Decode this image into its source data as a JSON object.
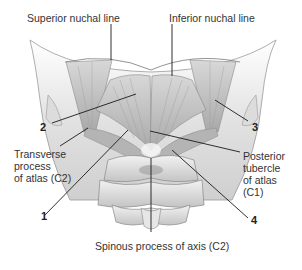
{
  "figure": {
    "type": "anatomical-illustration",
    "labels": {
      "superior_nuchal_line": "Superior nuchal line",
      "inferior_nuchal_line": "Inferior nuchal line",
      "transverse_process": "Transverse\nprocess\nof atlas (C2)",
      "posterior_tubercle": "Posterior\ntubercle\nof atlas\n(C1)",
      "spinous_process": "Spinous process of axis (C2)"
    },
    "numbers": {
      "n1": "1",
      "n2": "2",
      "n3": "3",
      "n4": "4"
    },
    "colors": {
      "background": "#ffffff",
      "bone": "#e4e4e4",
      "muscle": "#b9b9b9",
      "leader_line": "#1a1a1a"
    }
  }
}
